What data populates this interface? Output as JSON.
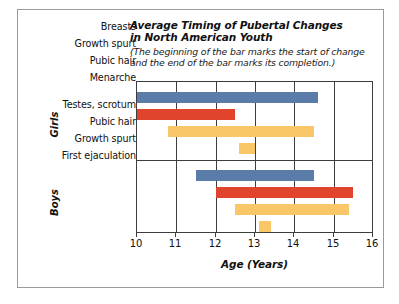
{
  "figure": {
    "title_lines": [
      "Average Timing of Pubertal Changes",
      "in North American Youth"
    ],
    "subtitle_lines": [
      "(The beginning of the bar marks the start of change",
      "and the end of the bar marks its completion.)"
    ],
    "border_color": "#9a9a9a",
    "axis_color": "#3d3d3d"
  },
  "chart_data": {
    "type": "bar",
    "orientation": "horizontal",
    "subtitle": "(The beginning of the bar marks the start of change and the end of the bar marks its completion.)",
    "xlabel": "Age (Years)",
    "ylabel": "",
    "xlim": [
      10,
      16
    ],
    "xticks": [
      10,
      11,
      12,
      13,
      14,
      15,
      16
    ],
    "xtick_labels": [
      "10",
      "11",
      "12",
      "13",
      "14",
      "15",
      "16"
    ],
    "grid": "vertical",
    "legend": "none",
    "note": "Each bar is a range bar spanning start age to end age.",
    "colors": {
      "blue": "#5b7ba8",
      "red": "#e0442c",
      "orange": "#f9c668"
    },
    "groups": [
      {
        "name": "Girls",
        "label": "Girls",
        "bars": [
          {
            "label": "Breasts",
            "start": 10.0,
            "end": 14.6,
            "color": "#5b7ba8"
          },
          {
            "label": "Growth spurt",
            "start": 10.0,
            "end": 12.5,
            "color": "#e0442c"
          },
          {
            "label": "Pubic hair",
            "start": 10.8,
            "end": 14.5,
            "color": "#f9c668"
          },
          {
            "label": "Menarche",
            "start": 12.6,
            "end": 13.0,
            "color": "#f9c668"
          }
        ]
      },
      {
        "name": "Boys",
        "label": "Boys",
        "bars": [
          {
            "label": "Testes, scrotum",
            "start": 11.5,
            "end": 14.5,
            "color": "#5b7ba8"
          },
          {
            "label": "Pubic hair",
            "start": 12.0,
            "end": 15.5,
            "color": "#e0442c"
          },
          {
            "label": "Growth spurt",
            "start": 12.5,
            "end": 15.4,
            "color": "#f9c668"
          },
          {
            "label": "First ejaculation",
            "start": 13.1,
            "end": 13.4,
            "color": "#f9c668"
          }
        ]
      }
    ]
  }
}
